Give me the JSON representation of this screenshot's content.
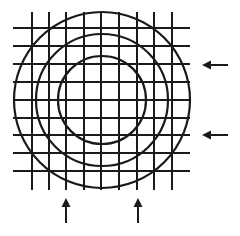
{
  "diagram": {
    "colors": {
      "background": "#ffffff",
      "stroke": "#1a1a1a"
    },
    "grid": {
      "vertical_lines_x": [
        32,
        49,
        66,
        84,
        101,
        119,
        137,
        154,
        172
      ],
      "vertical_span_y": [
        12,
        190
      ],
      "horizontal_lines_y": [
        28,
        46,
        64,
        82,
        100,
        118,
        135,
        153,
        171
      ],
      "horizontal_span_x": [
        13,
        190
      ]
    },
    "circles": {
      "center": [
        102,
        100
      ],
      "radii": [
        88,
        66,
        44
      ]
    },
    "arrows": [
      {
        "direction": "left",
        "x1": 228,
        "y1": 65,
        "x2": 202,
        "y2": 65
      },
      {
        "direction": "left",
        "x1": 228,
        "y1": 135,
        "x2": 202,
        "y2": 135
      },
      {
        "direction": "up",
        "x1": 66,
        "y1": 223,
        "x2": 66,
        "y2": 198
      },
      {
        "direction": "up",
        "x1": 138,
        "y1": 223,
        "x2": 138,
        "y2": 198
      }
    ]
  }
}
